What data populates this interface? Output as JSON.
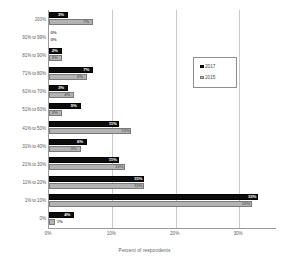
{
  "chart_data": {
    "type": "bar",
    "orientation": "horizontal",
    "title": "",
    "xlabel": "Percent of respondents",
    "ylabel": "",
    "xlim": [
      0,
      36
    ],
    "xticks": [
      "0%",
      "10%",
      "20%",
      "30%"
    ],
    "xtick_values": [
      0,
      10,
      20,
      30
    ],
    "grid": true,
    "legend_position": "upper right",
    "categories": [
      "100%",
      "91% to 99%",
      "81% to 90%",
      "71% to 80%",
      "61% to 70%",
      "51% to 60%",
      "41% to 50%",
      "31% to 40%",
      "21% to 30%",
      "11% to 20%",
      "1% to 10%",
      "0%"
    ],
    "series": [
      {
        "name": "2017",
        "color": "#0d0d0d",
        "values": [
          3,
          0,
          2,
          7,
          3,
          5,
          11,
          6,
          11,
          15,
          33,
          4
        ],
        "labels": [
          "3%",
          "0%",
          "2%",
          "7%",
          "3%",
          "5%",
          "11%",
          "6%",
          "11%",
          "15%",
          "33%",
          "4%"
        ]
      },
      {
        "name": "2015",
        "color": "#b3b3b3",
        "values": [
          7,
          0,
          2,
          6,
          4,
          2,
          13,
          5,
          12,
          15,
          32,
          1
        ],
        "labels": [
          "7%",
          "0%",
          "2%",
          "6%",
          "4%",
          "2%",
          "13%",
          "5%",
          "12%",
          "15%",
          "32%",
          "1%"
        ]
      }
    ]
  },
  "legend": {
    "items": [
      {
        "label": "2017"
      },
      {
        "label": "2015"
      }
    ]
  }
}
